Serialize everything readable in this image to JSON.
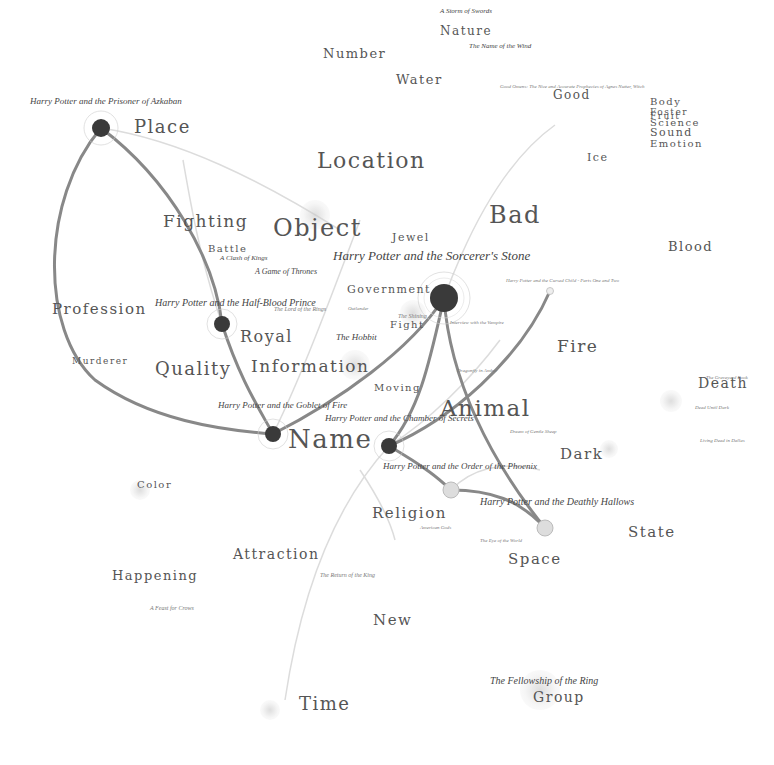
{
  "colors": {
    "background": "#ffffff",
    "theme_text": "#555555",
    "book_node_dark": "#3a3a3a",
    "book_node_light": "#dddddd",
    "edge_dark": "#888888",
    "edge_light": "#dadada",
    "minor_text": "#aaaaaa"
  },
  "themes": [
    {
      "label": "Number",
      "x": 323,
      "y": 60,
      "size": 13
    },
    {
      "label": "Nature",
      "x": 440,
      "y": 37,
      "size": 12
    },
    {
      "label": "Water",
      "x": 396,
      "y": 86,
      "size": 13
    },
    {
      "label": "Good",
      "x": 553,
      "y": 101,
      "size": 12
    },
    {
      "label": "Place",
      "x": 134,
      "y": 136,
      "size": 18
    },
    {
      "label": "Location",
      "x": 317,
      "y": 172,
      "size": 22
    },
    {
      "label": "Ice",
      "x": 587,
      "y": 163,
      "size": 11
    },
    {
      "label": "Body",
      "x": 650,
      "y": 107,
      "size": 10
    },
    {
      "label": "Foster",
      "x": 650,
      "y": 117,
      "size": 9
    },
    {
      "label": "Fruit",
      "x": 650,
      "y": 121,
      "size": 9
    },
    {
      "label": "Science",
      "x": 650,
      "y": 128,
      "size": 10
    },
    {
      "label": "Sound",
      "x": 650,
      "y": 138,
      "size": 11
    },
    {
      "label": "Emotion",
      "x": 650,
      "y": 149,
      "size": 10
    },
    {
      "label": "Fighting",
      "x": 163,
      "y": 230,
      "size": 17
    },
    {
      "label": "Object",
      "x": 273,
      "y": 240,
      "size": 24
    },
    {
      "label": "Jewel",
      "x": 392,
      "y": 243,
      "size": 11
    },
    {
      "label": "Bad",
      "x": 489,
      "y": 227,
      "size": 24
    },
    {
      "label": "Blood",
      "x": 668,
      "y": 253,
      "size": 13
    },
    {
      "label": "Battle",
      "x": 208,
      "y": 254,
      "size": 10
    },
    {
      "label": "Government",
      "x": 347,
      "y": 295,
      "size": 11
    },
    {
      "label": "Profession",
      "x": 52,
      "y": 317,
      "size": 15
    },
    {
      "label": "Fight",
      "x": 390,
      "y": 330,
      "size": 10
    },
    {
      "label": "Royal",
      "x": 240,
      "y": 345,
      "size": 16
    },
    {
      "label": "Fire",
      "x": 557,
      "y": 355,
      "size": 17
    },
    {
      "label": "Murderer",
      "x": 72,
      "y": 366,
      "size": 9
    },
    {
      "label": "Quality",
      "x": 155,
      "y": 378,
      "size": 18
    },
    {
      "label": "Information",
      "x": 251,
      "y": 375,
      "size": 17
    },
    {
      "label": "Moving",
      "x": 374,
      "y": 393,
      "size": 10
    },
    {
      "label": "Death",
      "x": 698,
      "y": 390,
      "size": 14
    },
    {
      "label": "Animal",
      "x": 440,
      "y": 420,
      "size": 23
    },
    {
      "label": "Name",
      "x": 288,
      "y": 452,
      "size": 26
    },
    {
      "label": "Dark",
      "x": 560,
      "y": 462,
      "size": 15
    },
    {
      "label": "Color",
      "x": 137,
      "y": 490,
      "size": 10
    },
    {
      "label": "Religion",
      "x": 372,
      "y": 521,
      "size": 15
    },
    {
      "label": "State",
      "x": 628,
      "y": 540,
      "size": 15
    },
    {
      "label": "Attraction",
      "x": 233,
      "y": 561,
      "size": 14
    },
    {
      "label": "Space",
      "x": 508,
      "y": 567,
      "size": 15
    },
    {
      "label": "Happening",
      "x": 112,
      "y": 582,
      "size": 13
    },
    {
      "label": "New",
      "x": 373,
      "y": 628,
      "size": 15
    },
    {
      "label": "Group",
      "x": 533,
      "y": 704,
      "size": 14
    },
    {
      "label": "Time",
      "x": 299,
      "y": 713,
      "size": 18
    }
  ],
  "books": [
    {
      "label": "Harry Potter and the Prisoner of Azkaban",
      "x": 30,
      "y": 106,
      "size": 9
    },
    {
      "label": "Harry Potter and the Sorcerer's Stone",
      "x": 333,
      "y": 262,
      "size": 13
    },
    {
      "label": "Harry Potter and the Half-Blood Prince",
      "x": 155,
      "y": 308,
      "size": 10
    },
    {
      "label": "Harry Potter and the Goblet of Fire",
      "x": 218,
      "y": 410,
      "size": 9
    },
    {
      "label": "Harry Potter and the Chamber of Secrets",
      "x": 325,
      "y": 423,
      "size": 9
    },
    {
      "label": "Harry Potter and the Order of the Phoenix",
      "x": 383,
      "y": 471,
      "size": 9
    },
    {
      "label": "Harry Potter and the Deathly Hallows",
      "x": 480,
      "y": 507,
      "size": 10
    },
    {
      "label": "A Game of Thrones",
      "x": 255,
      "y": 276,
      "size": 8
    },
    {
      "label": "A Clash of Kings",
      "x": 220,
      "y": 262,
      "size": 7
    },
    {
      "label": "The Hobbit",
      "x": 336,
      "y": 342,
      "size": 9
    },
    {
      "label": "The Lord of the Rings",
      "x": 274,
      "y": 312,
      "size": 6
    },
    {
      "label": "The Fellowship of the Ring",
      "x": 490,
      "y": 686,
      "size": 10
    },
    {
      "label": "The Return of the King",
      "x": 320,
      "y": 578,
      "size": 6
    },
    {
      "label": "A Storm of Swords",
      "x": 440,
      "y": 15,
      "size": 7
    },
    {
      "label": "The Name of the Wind",
      "x": 469,
      "y": 50,
      "size": 7
    },
    {
      "label": "Good Omens: The Nice and Accurate Prophecies of Agnes Nutter, Witch",
      "x": 500,
      "y": 89,
      "size": 5
    },
    {
      "label": "Harry Potter and the Cursed Child - Parts One and Two",
      "x": 506,
      "y": 283,
      "size": 5
    },
    {
      "label": "Interview with the Vampire",
      "x": 450,
      "y": 325,
      "size": 5
    },
    {
      "label": "Dragonfly in Amber",
      "x": 457,
      "y": 373,
      "size": 5
    },
    {
      "label": "The Eye of the World",
      "x": 480,
      "y": 543,
      "size": 5
    },
    {
      "label": "The Graveyard Book",
      "x": 706,
      "y": 380,
      "size": 5
    },
    {
      "label": "Dead Until Dark",
      "x": 695,
      "y": 410,
      "size": 5
    },
    {
      "label": "Living Dead in Dallas",
      "x": 700,
      "y": 443,
      "size": 5
    },
    {
      "label": "A Feast for Crows",
      "x": 150,
      "y": 611,
      "size": 6
    },
    {
      "label": "American Gods",
      "x": 420,
      "y": 530,
      "size": 5
    },
    {
      "label": "The Shining",
      "x": 398,
      "y": 319,
      "size": 6
    },
    {
      "label": "Outlander",
      "x": 348,
      "y": 311,
      "size": 5
    },
    {
      "label": "Dream of Gentle Sheep",
      "x": 510,
      "y": 434,
      "size": 5
    }
  ],
  "book_nodes": [
    {
      "name": "prisoner-of-azkaban",
      "x": 101,
      "y": 128,
      "r": 9,
      "dark": true
    },
    {
      "name": "sorcerers-stone",
      "x": 444,
      "y": 298,
      "r": 14,
      "dark": true
    },
    {
      "name": "half-blood-prince",
      "x": 222,
      "y": 324,
      "r": 8,
      "dark": true
    },
    {
      "name": "goblet-of-fire",
      "x": 273,
      "y": 434,
      "r": 8,
      "dark": true
    },
    {
      "name": "chamber-of-secrets",
      "x": 389,
      "y": 446,
      "r": 8,
      "dark": true
    },
    {
      "name": "order-of-the-phoenix",
      "x": 451,
      "y": 490,
      "r": 8,
      "dark": false
    },
    {
      "name": "deathly-hallows",
      "x": 545,
      "y": 528,
      "r": 8,
      "dark": false
    },
    {
      "name": "cursed-child",
      "x": 550,
      "y": 291,
      "r": 3,
      "dark": false
    }
  ]
}
